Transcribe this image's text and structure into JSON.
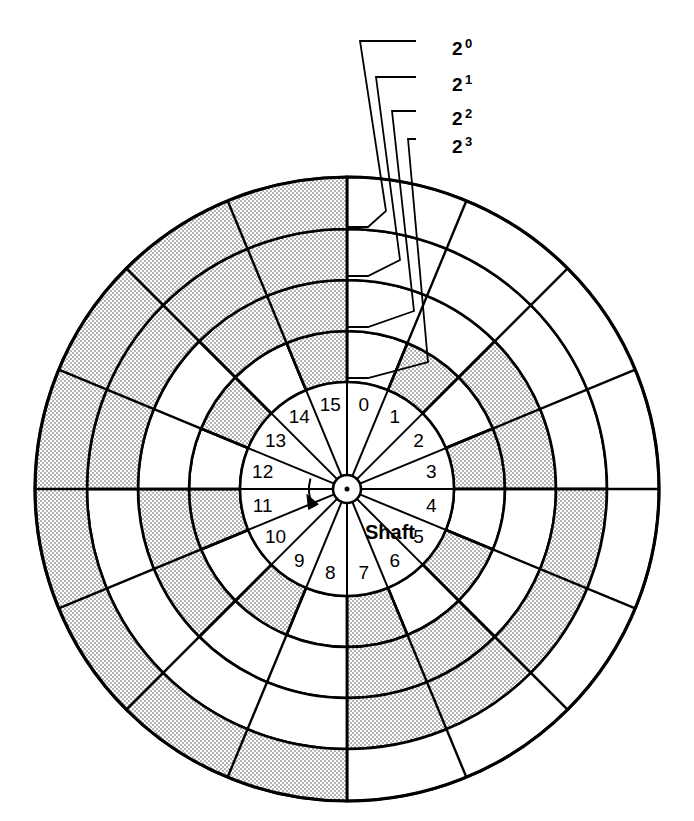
{
  "figure": {
    "name": "absolute-shaft-encoder-disk",
    "background_color": "#ffffff",
    "line_color": "#000000",
    "shaded_fill_color": "#d9d9d9",
    "unshaded_fill_color": "#ffffff"
  },
  "disk": {
    "center_x": 347,
    "center_y": 489,
    "outer_radius": 312,
    "sector_count": 16,
    "sector_angle_degrees": 22.5,
    "start_angle_degrees": -90,
    "hub_outer_radius": 14,
    "hub_dot_radius": 2.5,
    "ring_radii": [
      107,
      158,
      209,
      260,
      312
    ],
    "inner_label_ring": {
      "inner_radius": 20,
      "outer_radius": 107,
      "label_radius": 86
    }
  },
  "sector_numbers": [
    "0",
    "1",
    "2",
    "3",
    "4",
    "5",
    "6",
    "7",
    "8",
    "9",
    "10",
    "11",
    "12",
    "13",
    "14",
    "15"
  ],
  "shaft": {
    "label": "Shaft",
    "label_x": 365,
    "label_y": 539,
    "rotation_arrow": "counter-clockwise-arrow"
  },
  "tracks": [
    {
      "id": "track-2-0",
      "label": "2",
      "exponent": "0",
      "bit_weight": 1,
      "inner_radius": 107,
      "outer_radius": 158,
      "pattern": [
        0,
        1,
        0,
        1,
        0,
        1,
        0,
        1,
        0,
        1,
        0,
        1,
        0,
        1,
        0,
        1
      ],
      "leader_label_x": 452,
      "leader_label_y": 48,
      "leader_elbow_x": 416,
      "leader_elbow_y": 41,
      "leader_stub_x": 347,
      "leader_stub_y": 227,
      "leader_stub_end_x": 368,
      "leader_stub_end_y": 227
    },
    {
      "id": "track-2-1",
      "label": "2",
      "exponent": "1",
      "bit_weight": 2,
      "inner_radius": 158,
      "outer_radius": 209,
      "pattern": [
        0,
        0,
        1,
        1,
        0,
        0,
        1,
        1,
        0,
        0,
        1,
        1,
        0,
        0,
        1,
        1
      ],
      "leader_label_x": 452,
      "leader_label_y": 84,
      "leader_elbow_x": 416,
      "leader_elbow_y": 77,
      "leader_stub_x": 347,
      "leader_stub_y": 276,
      "leader_stub_end_x": 368,
      "leader_stub_end_y": 276
    },
    {
      "id": "track-2-2",
      "label": "2",
      "exponent": "2",
      "bit_weight": 4,
      "inner_radius": 209,
      "outer_radius": 260,
      "pattern": [
        0,
        0,
        0,
        0,
        1,
        1,
        1,
        1,
        0,
        0,
        0,
        0,
        1,
        1,
        1,
        1
      ],
      "leader_label_x": 452,
      "leader_label_y": 118,
      "leader_elbow_x": 416,
      "leader_elbow_y": 111,
      "leader_stub_x": 347,
      "leader_stub_y": 327,
      "leader_stub_end_x": 368,
      "leader_stub_end_y": 327
    },
    {
      "id": "track-2-3",
      "label": "2",
      "exponent": "3",
      "bit_weight": 8,
      "inner_radius": 260,
      "outer_radius": 312,
      "pattern": [
        0,
        0,
        0,
        0,
        0,
        0,
        0,
        0,
        1,
        1,
        1,
        1,
        1,
        1,
        1,
        1
      ],
      "leader_label_x": 452,
      "leader_label_y": 146,
      "leader_elbow_x": 416,
      "leader_elbow_y": 139,
      "leader_stub_x": 347,
      "leader_stub_y": 378,
      "leader_stub_end_x": 368,
      "leader_stub_end_y": 378
    }
  ],
  "stroke_widths": {
    "outer_circle": 3.2,
    "ring_boundary": 2.6,
    "sector_divider": 2.4,
    "inner_sector_divider": 2.0,
    "leader_line": 1.8,
    "hub": 2.6
  }
}
